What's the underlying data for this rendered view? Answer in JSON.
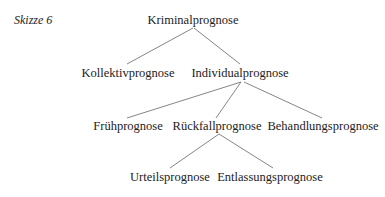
{
  "caption": "Skizze 6",
  "nodes": {
    "root": "Kriminalprognose",
    "kollektiv": "Kollektivprognose",
    "individual": "Individualprognose",
    "frueh": "Frühprognose",
    "rueckfall": "Rückfallprognose",
    "behandlung": "Behandlungsprognose",
    "urteil": "Urteilsprognose",
    "entlassung": "Entlassungsprognose"
  },
  "edges": [
    [
      "Kriminalprognose",
      "Kollektivprognose"
    ],
    [
      "Kriminalprognose",
      "Individualprognose"
    ],
    [
      "Individualprognose",
      "Frühprognose"
    ],
    [
      "Individualprognose",
      "Rückfallprognose"
    ],
    [
      "Individualprognose",
      "Behandlungsprognose"
    ],
    [
      "Rückfallprognose",
      "Urteilsprognose"
    ],
    [
      "Rückfallprognose",
      "Entlassungsprognose"
    ]
  ]
}
